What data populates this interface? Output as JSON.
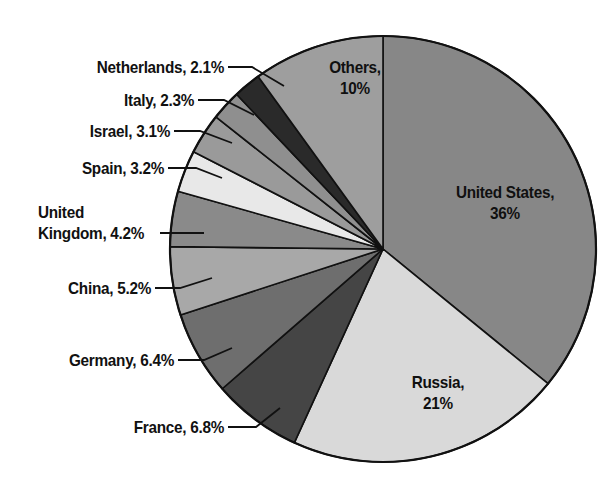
{
  "chart_data": {
    "type": "pie",
    "title": "",
    "subtitle": "",
    "xlabel": "",
    "ylabel": "",
    "legend_position": "none",
    "grid": false,
    "start_angle_deg": 0,
    "direction": "clockwise",
    "unit": "%",
    "categories": [
      "United States",
      "Russia",
      "France",
      "Germany",
      "China",
      "United Kingdom",
      "Spain",
      "Israel",
      "Italy",
      "Netherlands",
      "Others"
    ],
    "values": [
      36,
      21,
      6.8,
      6.4,
      5.2,
      4.2,
      3.2,
      3.1,
      2.3,
      2.1,
      10
    ],
    "slices": [
      {
        "name": "United States",
        "value": 36,
        "display": "36%",
        "label": "United States,\n36%",
        "color": "#878787",
        "label_placement": "inside"
      },
      {
        "name": "Russia",
        "value": 21,
        "display": "21%",
        "label": "Russia,\n21%",
        "color": "#d9d9d9",
        "label_placement": "inside"
      },
      {
        "name": "France",
        "value": 6.8,
        "display": "6.8%",
        "label": "France, 6.8%",
        "color": "#454545",
        "label_placement": "outside"
      },
      {
        "name": "Germany",
        "value": 6.4,
        "display": "6.4%",
        "label": "Germany, 6.4%",
        "color": "#6e6e6e",
        "label_placement": "outside"
      },
      {
        "name": "China",
        "value": 5.2,
        "display": "5.2%",
        "label": "China, 5.2%",
        "color": "#a8a8a8",
        "label_placement": "outside"
      },
      {
        "name": "United Kingdom",
        "value": 4.2,
        "display": "4.2%",
        "label": "United\nKingdom, 4.2%",
        "color": "#8a8a8a",
        "label_placement": "outside"
      },
      {
        "name": "Spain",
        "value": 3.2,
        "display": "3.2%",
        "label": "Spain, 3.2%",
        "color": "#e8e8e8",
        "label_placement": "outside"
      },
      {
        "name": "Israel",
        "value": 3.1,
        "display": "3.1%",
        "label": "Israel, 3.1%",
        "color": "#9a9a9a",
        "label_placement": "outside"
      },
      {
        "name": "Italy",
        "value": 2.3,
        "display": "2.3%",
        "label": "Italy, 2.3%",
        "color": "#8f8f8f",
        "label_placement": "outside"
      },
      {
        "name": "Netherlands",
        "value": 2.1,
        "display": "2.1%",
        "label": "Netherlands, 2.1%",
        "color": "#2a2a2a",
        "label_placement": "outside"
      },
      {
        "name": "Others",
        "value": 10,
        "display": "10%",
        "label": "Others,\n10%",
        "color": "#9e9e9e",
        "label_placement": "inside"
      }
    ]
  },
  "labels": {
    "united_states": "United States,\n36%",
    "russia": "Russia,\n21%",
    "others": "Others,\n10%",
    "france": "France, 6.8%",
    "germany": "Germany, 6.4%",
    "china": "China, 5.2%",
    "united_kingdom": "United\nKingdom, 4.2%",
    "spain": "Spain, 3.2%",
    "israel": "Israel, 3.1%",
    "italy": "Italy, 2.3%",
    "netherlands": "Netherlands, 2.1%"
  },
  "style": {
    "background": "#ffffff",
    "outline": "#111111",
    "text": "#111111"
  },
  "geometry": {
    "center_x": 383,
    "center_y": 249,
    "radius": 213
  }
}
